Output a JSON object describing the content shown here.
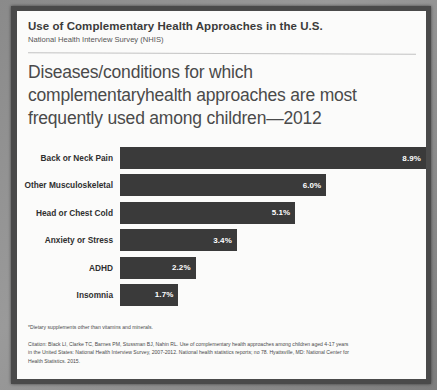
{
  "header": {
    "title": "Use of Complementary Health Approaches in the U.S.",
    "subtitle": "National Health Interview Survey (NHIS)"
  },
  "chart_data": {
    "type": "bar",
    "orientation": "horizontal",
    "title": "Diseases/conditions for which complementaryhealth approaches are most frequently used among children—2012",
    "xlabel": "",
    "ylabel": "",
    "xlim": [
      0,
      8.9
    ],
    "grid": false,
    "legend": null,
    "value_suffix": "%",
    "categories": [
      "Back or Neck Pain",
      "Other Musculoskeletal",
      "Head or Chest Cold",
      "Anxiety or Stress",
      "ADHD",
      "Insomnia"
    ],
    "values": [
      8.9,
      6.0,
      5.1,
      3.4,
      2.2,
      1.7
    ],
    "labels": [
      "8.9%",
      "6.0%",
      "5.1%",
      "3.4%",
      "2.2%",
      "1.7%"
    ],
    "bar_color": "#3a3a3a",
    "label_color": "#ffffff"
  },
  "footnote": "*Dietary supplements other than vitamins and minerals.",
  "citation": "Citation: Black LI, Clarke TC, Barnes PM, Stussman BJ, Nahin RL. Use of complementary health approaches among children aged 4-17 years in the United States: National Health Interview Survey, 2007-2012. National health statistics reports; no 78. Hyattsville, MD: National Center for Health Statistics. 2015."
}
